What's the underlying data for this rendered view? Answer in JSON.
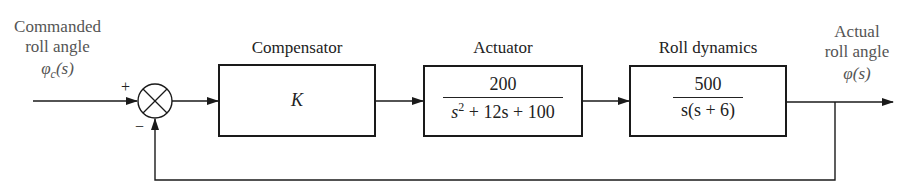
{
  "diagram": {
    "type": "feedback-control-block-diagram",
    "input": {
      "label_line1": "Commanded",
      "label_line2": "roll angle",
      "symbol": "φ",
      "subscript": "c",
      "arg": "(s)"
    },
    "summing_junction": {
      "plus_sign": "+",
      "minus_sign": "−"
    },
    "blocks": [
      {
        "title": "Compensator",
        "transfer_function": "K"
      },
      {
        "title": "Actuator",
        "numerator": "200",
        "denominator_s": "s",
        "denominator_exp": "2",
        "denominator_rest": " + 12s + 100"
      },
      {
        "title": "Roll dynamics",
        "numerator": "500",
        "denominator": "s(s + 6)"
      }
    ],
    "output": {
      "label_line1": "Actual",
      "label_line2": "roll angle",
      "symbol": "φ",
      "arg": "(s)"
    },
    "feedback": "unity negative feedback",
    "colors": {
      "lines": "#1a1a1a",
      "labels": "#555555",
      "background": "#ffffff"
    }
  }
}
